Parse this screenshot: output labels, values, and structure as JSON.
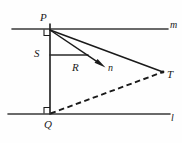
{
  "figure": {
    "width": 182,
    "height": 143,
    "background_color": "#fefefe",
    "stroke_color": "#1a1a1a"
  },
  "labels": {
    "P": "P",
    "S": "S",
    "R": "R",
    "n": "n",
    "T": "T",
    "Q": "Q",
    "m": "m",
    "l": "l"
  },
  "geometry": {
    "points": {
      "P": {
        "x": 50,
        "y": 29
      },
      "Q": {
        "x": 50,
        "y": 114
      },
      "S": {
        "x": 50,
        "y": 55
      },
      "T": {
        "x": 163,
        "y": 72
      },
      "S_end": {
        "x": 88,
        "y": 55
      },
      "arrow_tip": {
        "x": 105,
        "y": 67
      }
    },
    "line_m": {
      "x1": 12,
      "y1": 29,
      "x2": 168,
      "y2": 29
    },
    "line_l": {
      "x1": 8,
      "y1": 114,
      "x2": 170,
      "y2": 114
    },
    "segment_PQ": {
      "x1": 50,
      "y1": 24,
      "x2": 50,
      "y2": 114
    },
    "segment_SR": {
      "x1": 50,
      "y1": 55,
      "x2": 88,
      "y2": 55
    },
    "ray_Pn": {
      "x1": 50,
      "y1": 30,
      "x2": 105,
      "y2": 67
    },
    "segment_PT": {
      "x1": 50,
      "y1": 30,
      "x2": 163,
      "y2": 72
    },
    "dashed_QT": {
      "x1": 50,
      "y1": 114,
      "x2": 163,
      "y2": 72
    },
    "right_angle_P": {
      "x": 50,
      "y": 29,
      "size": 6
    },
    "right_angle_Q": {
      "x": 50,
      "y": 114,
      "size": 6
    }
  },
  "label_positions": {
    "P": {
      "left": 40,
      "top": 12
    },
    "S": {
      "left": 35,
      "top": 49
    },
    "R": {
      "left": 73,
      "top": 63
    },
    "n": {
      "left": 108,
      "top": 63
    },
    "T": {
      "left": 168,
      "top": 70
    },
    "Q": {
      "left": 45,
      "top": 119
    },
    "m": {
      "left": 170,
      "top": 21
    },
    "l": {
      "left": 170,
      "top": 114
    }
  }
}
